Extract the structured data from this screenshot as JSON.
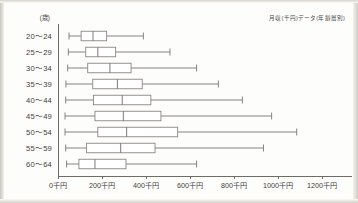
{
  "chart_data": {
    "type": "box",
    "title": "月収(千円)データ(年齢層別)",
    "xlabel": "",
    "ylabel": "",
    "y_unit_label": "(歳)",
    "xlim": [
      0,
      1300
    ],
    "x_ticks": [
      0,
      200,
      400,
      600,
      800,
      1000,
      1200
    ],
    "x_tick_labels": [
      "0千円",
      "200千円",
      "400千円",
      "600千円",
      "800千円",
      "1000千円",
      "1200千円"
    ],
    "grid": false,
    "legend": null,
    "orientation": "horizontal",
    "categories": [
      "20〜24",
      "25〜29",
      "30〜34",
      "35〜39",
      "40〜44",
      "45〜49",
      "50〜54",
      "55〜59",
      "60〜64"
    ],
    "boxes": [
      {
        "category": "20〜24",
        "min": 50,
        "q1": 105,
        "median": 159,
        "q3": 221,
        "max": 388
      },
      {
        "category": "25〜29",
        "min": 47,
        "q1": 126,
        "median": 181,
        "q3": 262,
        "max": 509
      },
      {
        "category": "30〜34",
        "min": 44,
        "q1": 135,
        "median": 236,
        "q3": 332,
        "max": 630
      },
      {
        "category": "35〜39",
        "min": 36,
        "q1": 158,
        "median": 270,
        "q3": 383,
        "max": 729
      },
      {
        "category": "40〜44",
        "min": 35,
        "q1": 161,
        "median": 292,
        "q3": 422,
        "max": 838
      },
      {
        "category": "45〜49",
        "min": 32,
        "q1": 168,
        "median": 297,
        "q3": 468,
        "max": 971
      },
      {
        "category": "50〜54",
        "min": 32,
        "q1": 181,
        "median": 312,
        "q3": 544,
        "max": 1085
      },
      {
        "category": "55〜59",
        "min": 35,
        "q1": 130,
        "median": 285,
        "q3": 441,
        "max": 934
      },
      {
        "category": "60〜64",
        "min": 39,
        "q1": 95,
        "median": 168,
        "q3": 309,
        "max": 630
      }
    ]
  },
  "colors": {
    "axis": "#6f6c66",
    "box_stroke": "#8a8782",
    "box_fill": "#ffffff",
    "text": "#3f3d3a",
    "background": "#fdfdfc"
  }
}
